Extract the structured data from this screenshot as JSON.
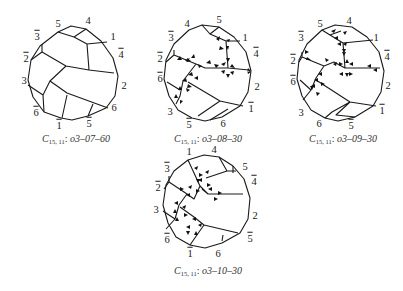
{
  "figure": {
    "panels": [
      {
        "id": "p1",
        "caption": {
          "symbol": "C",
          "subscript": "15, 11",
          "code": "o3–07–60"
        },
        "vertex_labels": [
          {
            "text": "5",
            "bar": false
          },
          {
            "text": "4",
            "bar": false
          },
          {
            "text": "1",
            "bar": false
          },
          {
            "text": "3",
            "bar": true
          },
          {
            "text": "4",
            "bar": true
          },
          {
            "text": "2",
            "bar": true
          },
          {
            "text": "2",
            "bar": false
          },
          {
            "text": "3",
            "bar": false
          },
          {
            "text": "6",
            "bar": false
          },
          {
            "text": "6",
            "bar": true
          },
          {
            "text": "1",
            "bar": true
          },
          {
            "text": "5",
            "bar": true
          }
        ],
        "has_arrows": false
      },
      {
        "id": "p2",
        "caption": {
          "symbol": "C",
          "subscript": "15, 11",
          "code": "o3–08–30"
        },
        "vertex_labels": [
          {
            "text": "4",
            "bar": false
          },
          {
            "text": "5",
            "bar": false
          },
          {
            "text": "1",
            "bar": false
          },
          {
            "text": "3",
            "bar": true
          },
          {
            "text": "4",
            "bar": true
          },
          {
            "text": "2",
            "bar": true
          },
          {
            "text": "6",
            "bar": true
          },
          {
            "text": "2",
            "bar": false
          },
          {
            "text": "3",
            "bar": false
          },
          {
            "text": "1",
            "bar": true
          },
          {
            "text": "5",
            "bar": true
          },
          {
            "text": "6",
            "bar": false
          }
        ],
        "has_arrows": true
      },
      {
        "id": "p3",
        "caption": {
          "symbol": "C",
          "subscript": "15, 11",
          "code": "o3–09–30"
        },
        "vertex_labels": [
          {
            "text": "5",
            "bar": false
          },
          {
            "text": "4",
            "bar": false
          },
          {
            "text": "1",
            "bar": false
          },
          {
            "text": "3",
            "bar": true
          },
          {
            "text": "4",
            "bar": true
          },
          {
            "text": "2",
            "bar": true
          },
          {
            "text": "6",
            "bar": true
          },
          {
            "text": "2",
            "bar": false
          },
          {
            "text": "3",
            "bar": false
          },
          {
            "text": "1",
            "bar": true
          },
          {
            "text": "6",
            "bar": false
          },
          {
            "text": "5",
            "bar": true
          }
        ],
        "has_arrows": true
      },
      {
        "id": "p4",
        "caption": {
          "symbol": "C",
          "subscript": "15, 11",
          "code": "o3–10–30"
        },
        "vertex_labels": [
          {
            "text": "1",
            "bar": false
          },
          {
            "text": "4",
            "bar": false
          },
          {
            "text": "5",
            "bar": false
          },
          {
            "text": "3",
            "bar": true
          },
          {
            "text": "4",
            "bar": true
          },
          {
            "text": "2",
            "bar": true
          },
          {
            "text": "3",
            "bar": false
          },
          {
            "text": "2",
            "bar": false
          },
          {
            "text": "6",
            "bar": true
          },
          {
            "text": "5",
            "bar": true
          },
          {
            "text": "1",
            "bar": true
          },
          {
            "text": "6",
            "bar": false
          }
        ],
        "has_arrows": true
      }
    ]
  }
}
